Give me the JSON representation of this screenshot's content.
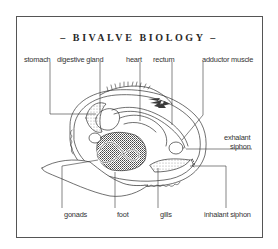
{
  "title": "– BIVALVE BIOLOGY –",
  "labels": {
    "stomach": "stomach",
    "digestive_gland": "digestive gland",
    "heart": "heart",
    "rectum": "rectum",
    "adductor_muscle": "adductor muscle",
    "exhalant_siphon_line1": "exhalant",
    "exhalant_siphon_line2": "siphon",
    "gonads": "gonads",
    "foot": "foot",
    "gills": "gills",
    "inhalant_siphon": "inhalant siphon"
  },
  "colors": {
    "line": "#333333",
    "frame": "#555555",
    "background": "#ffffff",
    "dark_fill": "#3a3a3a"
  }
}
